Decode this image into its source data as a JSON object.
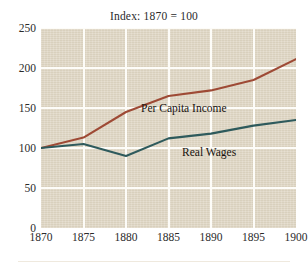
{
  "chart_data": {
    "type": "line",
    "title": "Index: 1870 = 100",
    "xlabel": "",
    "ylabel": "",
    "x": [
      1870,
      1875,
      1880,
      1885,
      1890,
      1895,
      1900
    ],
    "xlim": [
      1870,
      1900
    ],
    "ylim": [
      0,
      250
    ],
    "xticks": [
      "1870",
      "1875",
      "1880",
      "1885",
      "1890",
      "1895",
      "1900"
    ],
    "yticks": [
      "0",
      "50",
      "100",
      "150",
      "200",
      "250"
    ],
    "grid": true,
    "legend_position": "inline-annotation",
    "series": [
      {
        "name": "Per Capita Income",
        "color": "#9e4a35",
        "values": [
          100,
          113,
          145,
          165,
          172,
          185,
          211
        ]
      },
      {
        "name": "Real Wages",
        "color": "#2e5a5c",
        "values": [
          100,
          105,
          90,
          112,
          118,
          128,
          135
        ]
      }
    ],
    "annotations": [
      {
        "text": "Per Capita Income",
        "x": 1881,
        "y": 186
      },
      {
        "text": "Real Wages",
        "x": 1885.5,
        "y": 132
      }
    ]
  },
  "style": {
    "plot_background": "#ded5c2",
    "gridline_color": "#fdfcf8",
    "page_background": "#ffffff",
    "text_color": "#2b2b2b"
  }
}
